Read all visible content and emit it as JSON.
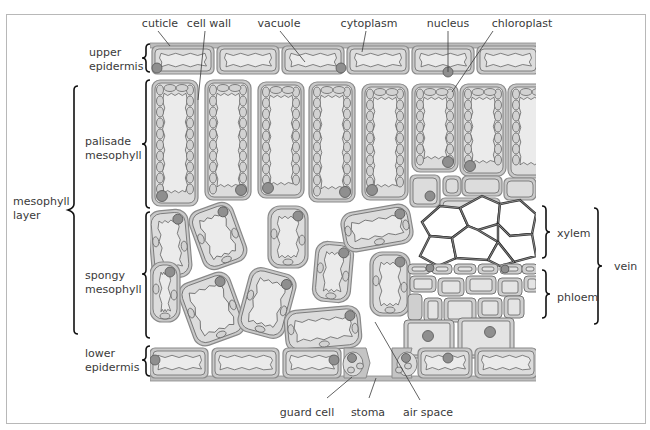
{
  "figure": {
    "labels": {
      "cuticle": "cuticle",
      "cell_wall": "cell wall",
      "vacuole": "vacuole",
      "cytoplasm": "cytoplasm",
      "nucleus": "nucleus",
      "chloroplast": "chloroplast",
      "upper_epidermis": [
        "upper",
        "epidermis"
      ],
      "palisade_mesophyll": [
        "palisade",
        "mesophyll"
      ],
      "mesophyll_layer": [
        "mesophyll",
        "layer"
      ],
      "spongy_mesophyll": [
        "spongy",
        "mesophyll"
      ],
      "lower_epidermis": [
        "lower",
        "epidermis"
      ],
      "xylem": "xylem",
      "phloem": "phloem",
      "vein": "vein",
      "guard_cell": "guard cell",
      "stoma": "stoma",
      "air_space": "air space"
    }
  },
  "colors": {
    "cell_wall": "#c9c9c9",
    "cytoplasm": "#dcdcdc",
    "vacuole": "#ebebeb",
    "nucleus": "#8f8f8f",
    "xylem_wall": "#333333",
    "frame": "#b8b8b8"
  }
}
